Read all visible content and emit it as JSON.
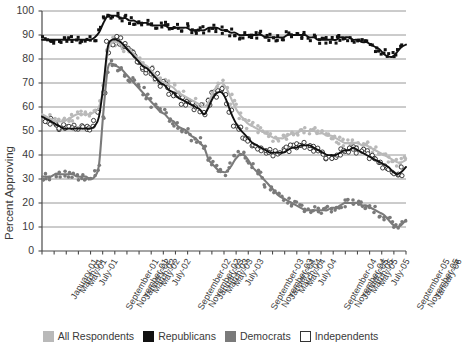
{
  "chart_data": {
    "type": "scatter",
    "title": "",
    "xlabel": "",
    "ylabel": "Percent Approving",
    "ylim": [
      0,
      100
    ],
    "yticks": [
      0,
      10,
      20,
      30,
      40,
      50,
      60,
      70,
      80,
      90,
      100
    ],
    "grid": true,
    "legend_position": "bottom",
    "x_tick_labels": [
      "January-01",
      "March-01",
      "May-01",
      "July-01",
      "September-01",
      "November-01",
      "January-02",
      "March-02",
      "May-02",
      "July-02",
      "September-02",
      "November-02",
      "January-03",
      "March-03",
      "May-03",
      "July-03",
      "September-03",
      "November-03",
      "January-04",
      "March-04",
      "May-04",
      "July-04",
      "September-04",
      "November-04",
      "January-05",
      "March-05",
      "May-05",
      "July-05",
      "September-05",
      "November-05",
      "January-06"
    ],
    "series": [
      {
        "name": "All Respondents",
        "color": "#b9b9b9",
        "marker": "filled-circle",
        "trend": [
          57,
          56,
          55,
          54,
          54,
          54,
          55,
          56,
          57,
          57,
          57,
          57,
          58,
          60,
          68,
          83,
          87,
          87,
          86,
          85,
          84,
          82,
          80,
          78,
          77,
          75,
          73,
          71,
          70,
          69,
          68,
          66,
          65,
          64,
          63,
          62,
          61,
          60,
          62,
          66,
          69,
          70,
          68,
          64,
          60,
          57,
          55,
          53,
          52,
          51,
          50,
          49,
          48,
          47,
          47,
          47,
          48,
          49,
          49,
          50,
          50,
          50,
          50,
          49,
          49,
          48,
          48,
          47,
          46,
          45,
          45,
          45,
          45,
          44,
          44,
          43,
          42,
          41,
          40,
          39,
          38,
          37,
          37,
          38
        ],
        "points_note": "dense biweekly poll readings scattered about the trend"
      },
      {
        "name": "Republicans",
        "color": "#111111",
        "marker": "filled-square",
        "trend": [
          88,
          88,
          88,
          88,
          88,
          88,
          88,
          88,
          88,
          88,
          88,
          88,
          89,
          91,
          95,
          98,
          98,
          98,
          97,
          97,
          96,
          96,
          95,
          95,
          95,
          94,
          94,
          94,
          94,
          93,
          93,
          93,
          93,
          93,
          92,
          92,
          92,
          92,
          93,
          93,
          93,
          92,
          92,
          91,
          91,
          90,
          90,
          90,
          90,
          90,
          90,
          89,
          89,
          89,
          89,
          89,
          90,
          90,
          90,
          90,
          90,
          89,
          89,
          88,
          88,
          88,
          88,
          88,
          89,
          89,
          89,
          88,
          88,
          87,
          87,
          86,
          85,
          84,
          82,
          81,
          81,
          83,
          85,
          86
        ]
      },
      {
        "name": "Democrats",
        "color": "#7a7a7a",
        "marker": "filled-circle",
        "trend": [
          31,
          31,
          31,
          32,
          32,
          32,
          32,
          32,
          31,
          31,
          31,
          30,
          31,
          36,
          58,
          76,
          78,
          77,
          76,
          74,
          72,
          70,
          68,
          66,
          64,
          62,
          60,
          58,
          57,
          55,
          54,
          52,
          51,
          50,
          48,
          47,
          45,
          43,
          38,
          36,
          34,
          33,
          33,
          35,
          38,
          40,
          40,
          38,
          35,
          33,
          31,
          29,
          27,
          25,
          23,
          22,
          21,
          20,
          19,
          18,
          17,
          17,
          17,
          17,
          17,
          17,
          18,
          18,
          19,
          20,
          20,
          20,
          20,
          19,
          19,
          18,
          17,
          16,
          15,
          13,
          11,
          10,
          11,
          13
        ]
      },
      {
        "name": "Independents",
        "color": "#ffffff",
        "edge_color": "#111111",
        "marker": "open-circle",
        "trend": [
          56,
          55,
          54,
          53,
          52,
          51,
          51,
          51,
          51,
          51,
          51,
          51,
          52,
          56,
          69,
          85,
          88,
          88,
          87,
          85,
          83,
          81,
          79,
          77,
          76,
          74,
          72,
          70,
          69,
          67,
          66,
          64,
          63,
          62,
          61,
          60,
          59,
          57,
          60,
          64,
          66,
          66,
          63,
          58,
          54,
          51,
          49,
          47,
          45,
          44,
          43,
          42,
          41,
          41,
          41,
          41,
          42,
          43,
          43,
          44,
          44,
          44,
          43,
          42,
          41,
          40,
          40,
          40,
          41,
          42,
          42,
          43,
          42,
          41,
          40,
          39,
          38,
          37,
          36,
          35,
          33,
          32,
          33,
          35
        ]
      }
    ]
  },
  "legend": {
    "items": [
      {
        "label": "All Respondents",
        "swatch": "#b9b9b9",
        "style": "filled"
      },
      {
        "label": "Republicans",
        "swatch": "#111111",
        "style": "filled"
      },
      {
        "label": "Democrats",
        "swatch": "#7a7a7a",
        "style": "filled"
      },
      {
        "label": "Independents",
        "swatch": "#ffffff",
        "style": "outline"
      }
    ]
  },
  "axes": {
    "y_title": "Percent Approving",
    "y_tick_labels": [
      "0",
      "10",
      "20",
      "30",
      "40",
      "50",
      "60",
      "70",
      "80",
      "90",
      "100"
    ]
  },
  "colors": {
    "all_respondents": "#b9b9b9",
    "republicans": "#111111",
    "democrats": "#7a7a7a",
    "independents": "#ffffff",
    "axis": "#4a4a4a",
    "grid": "#8c8c8c",
    "text": "#3a3a3a",
    "background": "#ffffff"
  }
}
